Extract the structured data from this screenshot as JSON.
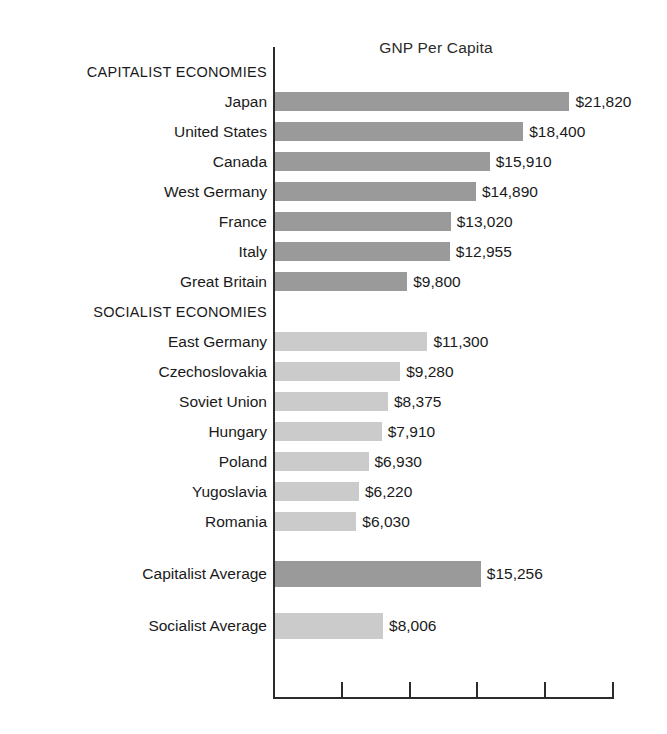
{
  "chart_data": {
    "type": "bar",
    "orientation": "horizontal",
    "title": "GNP Per Capita",
    "xlabel": "",
    "ylabel": "",
    "xlim": [
      0,
      25000
    ],
    "grid": false,
    "legend": null,
    "axis_ticks_labeled": false,
    "tick_count": 6,
    "value_prefix": "$",
    "colors": {
      "capitalist_bar": "#9a9a9a",
      "socialist_bar": "#cbcbcb",
      "axis": "#2b2b2b",
      "text": "#1a1a1a",
      "background": "#ffffff"
    },
    "sections": [
      {
        "heading": "CAPITALIST ECONOMIES"
      },
      {
        "heading": "SOCIALIST ECONOMIES"
      }
    ],
    "categories": [
      "Japan",
      "United States",
      "Canada",
      "West Germany",
      "France",
      "Italy",
      "Great Britain",
      "East Germany",
      "Czechoslovakia",
      "Soviet Union",
      "Hungary",
      "Poland",
      "Yugoslavia",
      "Romania",
      "Capitalist Average",
      "Socialist Average"
    ],
    "values": [
      21820,
      18400,
      15910,
      14890,
      13020,
      12955,
      9800,
      11300,
      9280,
      8375,
      7910,
      6930,
      6220,
      6030,
      15256,
      8006
    ]
  },
  "rows": [
    {
      "kind": "section",
      "label": "CAPITALIST ECONOMIES"
    },
    {
      "kind": "bar",
      "label": "Japan",
      "value": 21820,
      "value_label": "$21,820",
      "group": "capitalist"
    },
    {
      "kind": "bar",
      "label": "United States",
      "value": 18400,
      "value_label": "$18,400",
      "group": "capitalist"
    },
    {
      "kind": "bar",
      "label": "Canada",
      "value": 15910,
      "value_label": "$15,910",
      "group": "capitalist"
    },
    {
      "kind": "bar",
      "label": "West Germany",
      "value": 14890,
      "value_label": "$14,890",
      "group": "capitalist"
    },
    {
      "kind": "bar",
      "label": "France",
      "value": 13020,
      "value_label": "$13,020",
      "group": "capitalist"
    },
    {
      "kind": "bar",
      "label": "Italy",
      "value": 12955,
      "value_label": "$12,955",
      "group": "capitalist"
    },
    {
      "kind": "bar",
      "label": "Great Britain",
      "value": 9800,
      "value_label": "$9,800",
      "group": "capitalist"
    },
    {
      "kind": "section",
      "label": "SOCIALIST ECONOMIES"
    },
    {
      "kind": "bar",
      "label": "East Germany",
      "value": 11300,
      "value_label": "$11,300",
      "group": "socialist"
    },
    {
      "kind": "bar",
      "label": "Czechoslovakia",
      "value": 9280,
      "value_label": "$9,280",
      "group": "socialist"
    },
    {
      "kind": "bar",
      "label": "Soviet Union",
      "value": 8375,
      "value_label": "$8,375",
      "group": "socialist"
    },
    {
      "kind": "bar",
      "label": "Hungary",
      "value": 7910,
      "value_label": "$7,910",
      "group": "socialist"
    },
    {
      "kind": "bar",
      "label": "Poland",
      "value": 6930,
      "value_label": "$6,930",
      "group": "socialist"
    },
    {
      "kind": "bar",
      "label": "Yugoslavia",
      "value": 6220,
      "value_label": "$6,220",
      "group": "socialist"
    },
    {
      "kind": "bar",
      "label": "Romania",
      "value": 6030,
      "value_label": "$6,030",
      "group": "socialist"
    },
    {
      "kind": "spacer"
    },
    {
      "kind": "bar",
      "label": "Capitalist Average",
      "value": 15256,
      "value_label": "$15,256",
      "group": "capitalist",
      "average": true
    },
    {
      "kind": "spacer"
    },
    {
      "kind": "bar",
      "label": "Socialist Average",
      "value": 8006,
      "value_label": "$8,006",
      "group": "socialist",
      "average": true
    }
  ]
}
